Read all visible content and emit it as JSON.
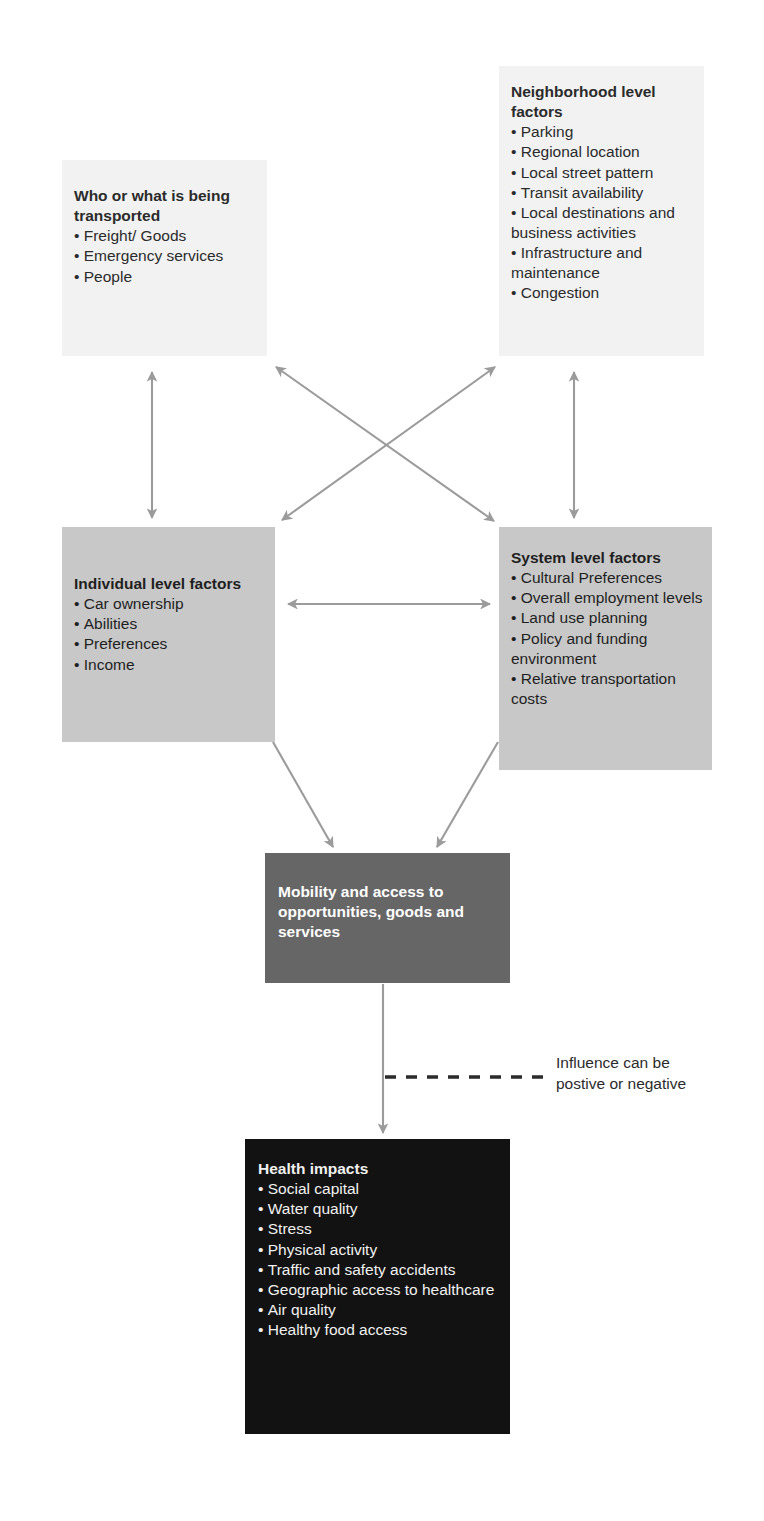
{
  "diagram": {
    "title_text_present": false,
    "colors": {
      "box_light": "#f2f2f2",
      "box_mid": "#c8c8c8",
      "box_dark": "#666666",
      "box_black": "#121212",
      "arrow": "#9b9b9b",
      "dashed": "#2b2b2b",
      "text_dark": "#2b2b2b",
      "text_light": "#ffffff"
    },
    "boxes": {
      "transported": {
        "title": "Who or what is being transported",
        "items": [
          "Freight/ Goods",
          "Emergency services",
          "People"
        ]
      },
      "neighborhood": {
        "title": "Neighborhood level factors",
        "items": [
          "Parking",
          "Regional location",
          "Local street pattern",
          "Transit availability",
          "Local destinations and business activities",
          "Infrastructure and maintenance",
          "Congestion"
        ]
      },
      "individual": {
        "title": "Individual level factors",
        "items": [
          "Car ownership",
          "Abilities",
          "Preferences",
          "Income"
        ]
      },
      "system": {
        "title": "System level factors",
        "items": [
          "Cultural Preferences",
          "Overall employment levels",
          "Land use planning",
          "Policy and funding environment",
          "Relative transportation costs"
        ]
      },
      "mobility": {
        "title": "Mobility and access to opportunities, goods and services",
        "items": []
      },
      "health": {
        "title": "Health impacts",
        "items": [
          "Social capital",
          "Water quality",
          "Stress",
          "Physical activity",
          "Traffic and safety accidents",
          "Geographic access to healthcare",
          "Air quality",
          "Healthy food access"
        ]
      }
    },
    "annotations": {
      "influence_line1": "Influence can be",
      "influence_line2": "postive or negative"
    },
    "connectors": [
      {
        "name": "transported-individual",
        "style": "double-arrow",
        "kind": "vertical"
      },
      {
        "name": "neighborhood-system",
        "style": "double-arrow",
        "kind": "vertical"
      },
      {
        "name": "transported-system",
        "style": "double-arrow",
        "kind": "diagonal"
      },
      {
        "name": "neighborhood-individual",
        "style": "double-arrow",
        "kind": "diagonal"
      },
      {
        "name": "individual-system",
        "style": "double-arrow",
        "kind": "horizontal"
      },
      {
        "name": "individual-mobility",
        "style": "single-arrow",
        "kind": "diagonal"
      },
      {
        "name": "system-mobility",
        "style": "single-arrow",
        "kind": "diagonal"
      },
      {
        "name": "mobility-health",
        "style": "single-arrow",
        "kind": "vertical"
      },
      {
        "name": "influence-dashed",
        "style": "dashed",
        "kind": "horizontal"
      }
    ]
  }
}
